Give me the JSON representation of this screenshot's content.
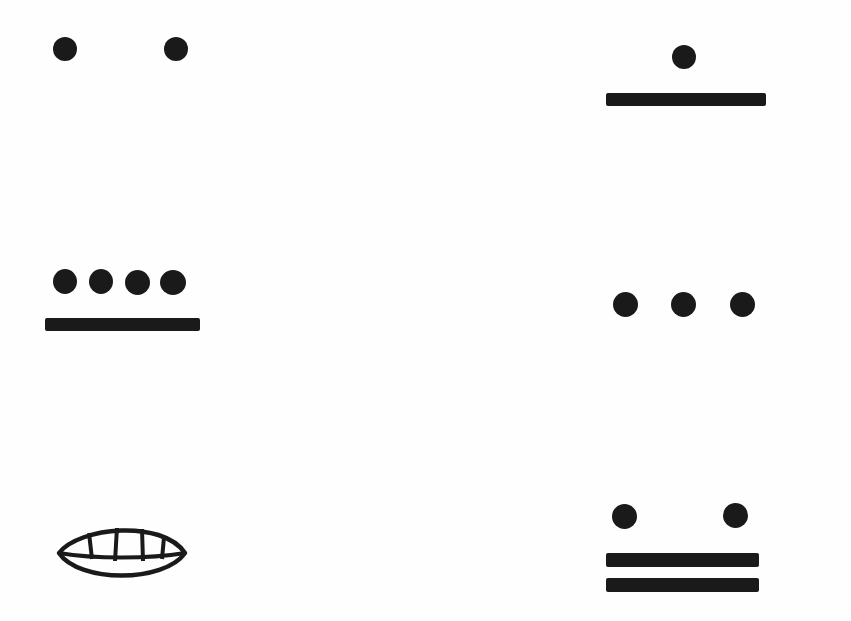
{
  "diagram": {
    "ink_color": "#1a1a1a",
    "background": "#fefefe",
    "numerals": [
      {
        "id": "n2",
        "value": 2,
        "dots": 2,
        "bars": 0,
        "position": "top-left"
      },
      {
        "id": "n6",
        "value": 6,
        "dots": 1,
        "bars": 1,
        "position": "top-right"
      },
      {
        "id": "n9",
        "value": 9,
        "dots": 4,
        "bars": 1,
        "position": "middle-left"
      },
      {
        "id": "n3",
        "value": 3,
        "dots": 3,
        "bars": 0,
        "position": "middle-right"
      },
      {
        "id": "n0",
        "value": 0,
        "dots": 0,
        "bars": 0,
        "shell": true,
        "position": "bottom-left"
      },
      {
        "id": "n12",
        "value": 12,
        "dots": 2,
        "bars": 2,
        "position": "bottom-right"
      }
    ]
  }
}
